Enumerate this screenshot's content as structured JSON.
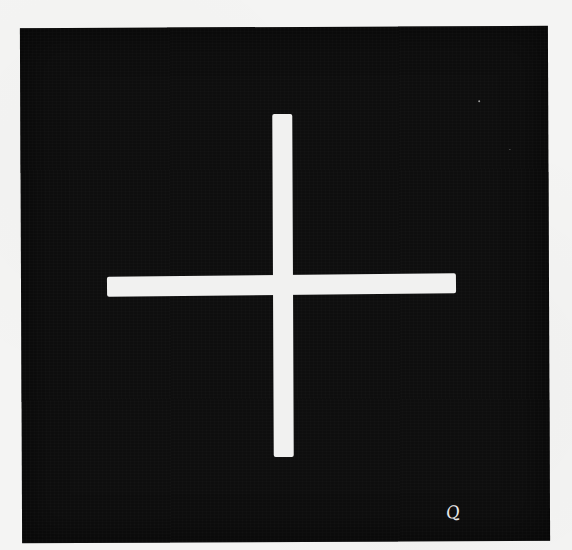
{
  "image": {
    "description": "Scanned figure: white plus-sign (fixation cross) on a black square, on white paper",
    "colors": {
      "paper": "#f4f4f3",
      "square": "#0e0e0e",
      "cross": "#f1f1f0",
      "mark": "#e8e8e8"
    },
    "elements": {
      "square": {
        "x": 21,
        "y": 27,
        "width": 528,
        "height": 515
      },
      "cross_vertical": {
        "x": 273,
        "y": 114,
        "width": 20,
        "height": 343
      },
      "cross_horizontal": {
        "x": 107,
        "y": 275,
        "width": 349,
        "height": 20
      }
    },
    "handwritten_mark": "Q"
  }
}
